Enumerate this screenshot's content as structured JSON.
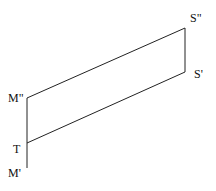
{
  "diagram": {
    "type": "parallelogram-projection",
    "points": {
      "S2": {
        "label": "S\"",
        "x": 185,
        "y": 28
      },
      "S1": {
        "label": "S'",
        "x": 185,
        "y": 72
      },
      "M2": {
        "label": "M\"",
        "x": 27,
        "y": 98
      },
      "T": {
        "label": "T",
        "x": 27,
        "y": 143
      },
      "M1": {
        "label": "M'",
        "x": 27,
        "y": 168
      }
    },
    "edges": [
      [
        "M2",
        "S2"
      ],
      [
        "S2",
        "S1"
      ],
      [
        "S1",
        "T"
      ],
      [
        "M2",
        "M1"
      ]
    ],
    "colors": {
      "line": "#222222",
      "text": "#111111",
      "background": "#ffffff"
    }
  }
}
